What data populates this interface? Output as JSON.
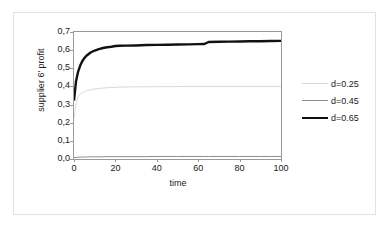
{
  "chart_data": {
    "type": "line",
    "title": "",
    "xlabel": "time",
    "ylabel": "supplier 6' profit",
    "xlim": [
      0,
      100
    ],
    "ylim": [
      0.0,
      0.7
    ],
    "grid": false,
    "legend_position": "right",
    "x_ticks": [
      "0",
      "20",
      "40",
      "60",
      "80",
      "100"
    ],
    "x_tick_values": [
      0,
      20,
      40,
      60,
      80,
      100
    ],
    "y_ticks": [
      "0,0",
      "0,1",
      "0,2",
      "0,3",
      "0,4",
      "0,5",
      "0,6",
      "0,7"
    ],
    "y_tick_values": [
      0.0,
      0.1,
      0.2,
      0.3,
      0.4,
      0.5,
      0.6,
      0.7
    ],
    "x": [
      0,
      1,
      2,
      3,
      4,
      5,
      6,
      8,
      10,
      12,
      14,
      16,
      18,
      20,
      22,
      25,
      30,
      35,
      40,
      45,
      50,
      55,
      60,
      63,
      65,
      70,
      75,
      80,
      85,
      90,
      95,
      100
    ],
    "series": [
      {
        "name": "d=0.25",
        "color": "#d9d9d9",
        "width": 1,
        "values": [
          0.225,
          0.305,
          0.345,
          0.358,
          0.365,
          0.371,
          0.376,
          0.382,
          0.386,
          0.389,
          0.391,
          0.393,
          0.394,
          0.395,
          0.396,
          0.397,
          0.398,
          0.398,
          0.399,
          0.399,
          0.399,
          0.4,
          0.4,
          0.4,
          0.4,
          0.4,
          0.4,
          0.4,
          0.4,
          0.4,
          0.4,
          0.4
        ]
      },
      {
        "name": "d=0.45",
        "color": "#8c8c8c",
        "width": 1,
        "values": [
          0.008,
          0.009,
          0.01,
          0.01,
          0.011,
          0.011,
          0.011,
          0.012,
          0.012,
          0.012,
          0.012,
          0.013,
          0.013,
          0.013,
          0.013,
          0.013,
          0.013,
          0.013,
          0.014,
          0.014,
          0.014,
          0.014,
          0.014,
          0.014,
          0.014,
          0.014,
          0.014,
          0.014,
          0.014,
          0.014,
          0.014,
          0.014
        ]
      },
      {
        "name": "d=0.65",
        "color": "#111111",
        "width": 2.4,
        "values": [
          0.322,
          0.43,
          0.482,
          0.515,
          0.539,
          0.556,
          0.569,
          0.587,
          0.598,
          0.606,
          0.612,
          0.616,
          0.619,
          0.623,
          0.624,
          0.625,
          0.626,
          0.628,
          0.629,
          0.63,
          0.631,
          0.632,
          0.633,
          0.634,
          0.645,
          0.646,
          0.647,
          0.648,
          0.649,
          0.649,
          0.65,
          0.651
        ]
      }
    ]
  },
  "legend": {
    "items": [
      {
        "label": "d=0.25"
      },
      {
        "label": "d=0.45"
      },
      {
        "label": "d=0.65"
      }
    ]
  }
}
